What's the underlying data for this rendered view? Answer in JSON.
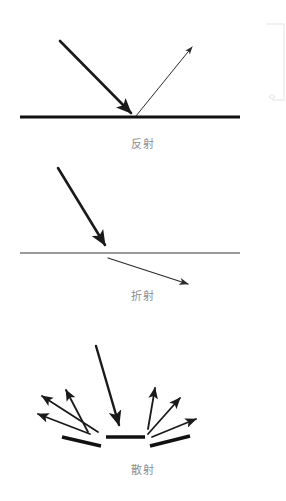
{
  "page": {
    "background_color": "#ffffff",
    "width": 286,
    "height": 501
  },
  "colors": {
    "ray_dark": "#1a1a1a",
    "ray_thin": "#2b2b2b",
    "surface_black": "#111111",
    "surface_gray": "#9a9a9a",
    "caption_text": "#8f8f8f",
    "artifact_gray": "#ededed"
  },
  "diagrams": [
    {
      "id": "reflection",
      "caption": "反射",
      "caption_label": "反射",
      "surface": {
        "name": "mirror-surface",
        "x1": 20,
        "y1": 117,
        "x2": 240,
        "y2": 117,
        "color": "#111111",
        "width": 3,
        "style": "solid-black"
      },
      "rays": [
        {
          "name": "incident-ray",
          "label": "入射光线",
          "x1": 60,
          "y1": 41,
          "x2": 134,
          "y2": 116,
          "thickness": 2.6,
          "arrowhead": "end",
          "color": "#1a1a1a"
        },
        {
          "name": "reflected-ray",
          "label": "反射光线",
          "x1": 136,
          "y1": 116,
          "x2": 194,
          "y2": 45,
          "thickness": 1.0,
          "arrowhead": "end",
          "color": "#2b2b2b"
        }
      ]
    },
    {
      "id": "refraction",
      "caption": "折射",
      "caption_label": "折射",
      "surface": {
        "name": "interface-surface",
        "x1": 20,
        "y1": 253,
        "x2": 240,
        "y2": 253,
        "color": "#9a9a9a",
        "width": 2,
        "style": "solid-gray"
      },
      "rays": [
        {
          "name": "incident-ray",
          "label": "入射光线",
          "x1": 58,
          "y1": 168,
          "x2": 108,
          "y2": 250,
          "thickness": 2.6,
          "arrowhead": "end",
          "color": "#1a1a1a"
        },
        {
          "name": "refracted-ray",
          "label": "折射光线",
          "x1": 108,
          "y1": 258,
          "x2": 193,
          "y2": 286,
          "thickness": 1.2,
          "arrowhead": "end",
          "color": "#2b2b2b"
        }
      ]
    },
    {
      "id": "scattering",
      "caption": "散射",
      "caption_label": "散射",
      "surface_segments": [
        {
          "name": "rough-surface-segment-left",
          "x1": 62,
          "y1": 437,
          "x2": 101,
          "y2": 445,
          "width": 3.2
        },
        {
          "name": "rough-surface-segment-center",
          "x1": 106,
          "y1": 437,
          "x2": 145,
          "y2": 437,
          "width": 3.2
        },
        {
          "name": "rough-surface-segment-right",
          "x1": 150,
          "y1": 445,
          "x2": 190,
          "y2": 436,
          "width": 3.2
        }
      ],
      "rays": [
        {
          "name": "incident-ray",
          "label": "入射光线",
          "x1": 96,
          "y1": 346,
          "x2": 121,
          "y2": 430,
          "thickness": 2.4,
          "arrowhead": "end",
          "color": "#1a1a1a"
        },
        {
          "name": "scattered-ray-1",
          "label": "散射光线",
          "x1": 98,
          "y1": 432,
          "x2": 39,
          "y2": 393,
          "thickness": 1.8,
          "arrowhead": "end",
          "color": "#1a1a1a"
        },
        {
          "name": "scattered-ray-2",
          "label": "散射光线",
          "x1": 90,
          "y1": 434,
          "x2": 35,
          "y2": 413,
          "thickness": 1.8,
          "arrowhead": "end",
          "color": "#1a1a1a"
        },
        {
          "name": "scattered-ray-3",
          "label": "散射光线",
          "x1": 88,
          "y1": 432,
          "x2": 64,
          "y2": 386,
          "thickness": 1.8,
          "arrowhead": "end",
          "color": "#1a1a1a"
        },
        {
          "name": "scattered-ray-4",
          "label": "散射光线",
          "x1": 148,
          "y1": 429,
          "x2": 156,
          "y2": 384,
          "thickness": 1.8,
          "arrowhead": "end",
          "color": "#1a1a1a"
        },
        {
          "name": "scattered-ray-5",
          "label": "散射光线",
          "x1": 148,
          "y1": 434,
          "x2": 183,
          "y2": 395,
          "thickness": 1.8,
          "arrowhead": "end",
          "color": "#1a1a1a"
        },
        {
          "name": "scattered-ray-6",
          "label": "散射光线",
          "x1": 152,
          "y1": 437,
          "x2": 200,
          "y2": 418,
          "thickness": 1.8,
          "arrowhead": "end",
          "color": "#1a1a1a"
        }
      ]
    }
  ],
  "artifact": {
    "name": "scan-edge-artifact",
    "x": 265,
    "y": 24,
    "width": 20,
    "height": 78,
    "color": "#ededed"
  }
}
